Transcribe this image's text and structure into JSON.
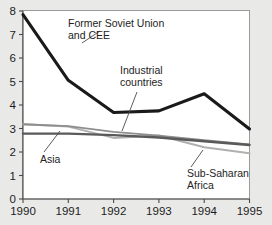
{
  "chart_data": {
    "type": "line",
    "title": "",
    "subtitle": "",
    "xlabel": "",
    "ylabel": "",
    "categories": [
      "1990",
      "1991",
      "1992",
      "1993",
      "1994",
      "1995"
    ],
    "x": [
      1990,
      1991,
      1992,
      1993,
      1994,
      1995
    ],
    "xlim": [
      1990,
      1995
    ],
    "ylim": [
      0,
      8
    ],
    "yticks": [
      "0",
      "1",
      "2",
      "3",
      "4",
      "5",
      "6",
      "7",
      "8"
    ],
    "grid": false,
    "legend_position": "inline-annotations",
    "series": [
      {
        "name": "Former Soviet Union and CEE",
        "color": "#1a1a1a",
        "width": 3.1,
        "values": [
          7.85,
          5.05,
          3.68,
          3.75,
          4.48,
          2.98
        ]
      },
      {
        "name": "Industrial countries",
        "color": "#5a5a5a",
        "width": 2.4,
        "values": [
          2.78,
          2.78,
          2.72,
          2.62,
          2.46,
          2.3
        ]
      },
      {
        "name": "Asia",
        "color": "#8e8e8e",
        "width": 1.8,
        "values": [
          3.18,
          3.1,
          2.86,
          2.7,
          2.5,
          2.32
        ]
      },
      {
        "name": "Sub-Saharan Africa",
        "color": "#b0b0b0",
        "width": 2.0,
        "values": [
          3.18,
          3.08,
          2.6,
          2.7,
          2.2,
          1.95
        ]
      }
    ],
    "annotations": [
      {
        "id": "fsu",
        "lines": [
          "Former Soviet Union",
          "and CEE"
        ],
        "text_x": 68,
        "text_y": 27,
        "leader": {
          "x1": 82,
          "y1": 43,
          "x2": 100,
          "y2": 31
        }
      },
      {
        "id": "industrial",
        "lines": [
          "Industrial",
          "countries"
        ],
        "text_x": 120,
        "text_y": 74,
        "leader": {
          "x1": 122,
          "y1": 131,
          "x2": 137,
          "y2": 92
        }
      },
      {
        "id": "asia",
        "lines": [
          "Asia"
        ],
        "text_x": 40,
        "text_y": 163,
        "leader": {
          "x1": 44,
          "y1": 152,
          "x2": 60,
          "y2": 131
        }
      },
      {
        "id": "ssa",
        "lines": [
          "Sub-Saharan",
          "Africa"
        ],
        "text_x": 187,
        "text_y": 177,
        "leader": {
          "x1": 191,
          "y1": 167,
          "x2": 203,
          "y2": 150
        }
      }
    ]
  },
  "colors": {
    "page_background": "#e9e9e7",
    "plot_background": "#ffffff",
    "axis": "#4a4a4a",
    "text": "#1d1d1d"
  }
}
